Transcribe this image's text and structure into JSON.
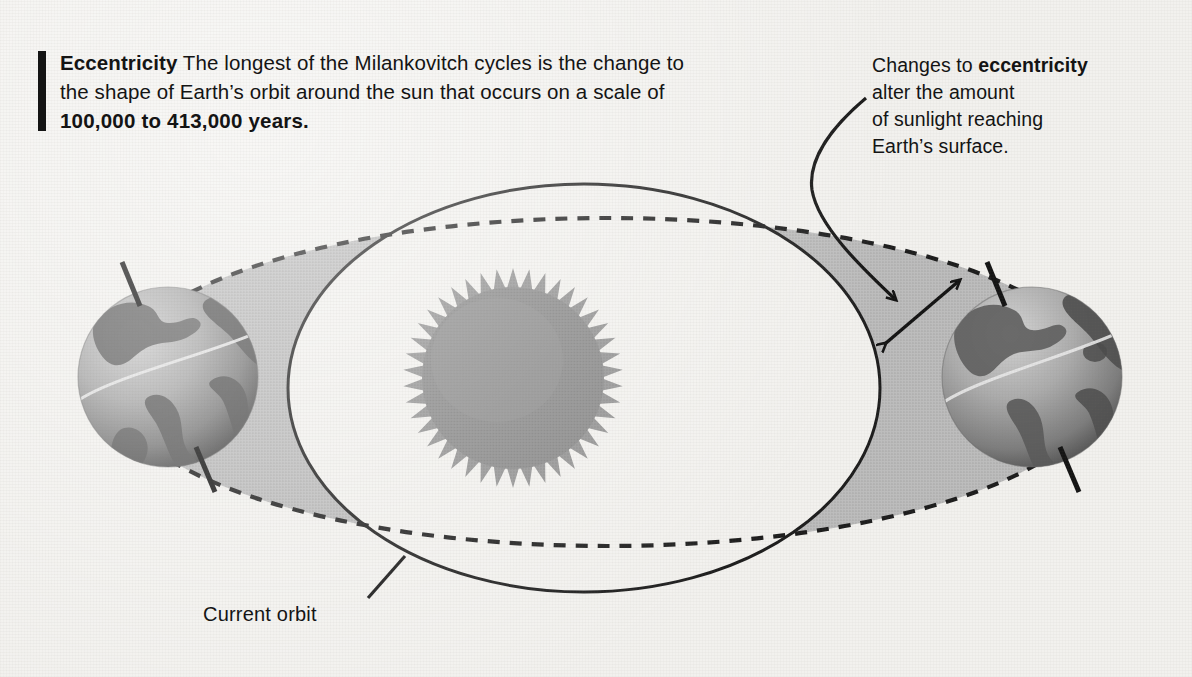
{
  "figure": {
    "title_term": "Eccentricity",
    "background_color": "#f2f1ee",
    "ink_color": "#141414",
    "shade_color": "#b9b9b9"
  },
  "callout": {
    "lead": "Eccentricity",
    "body_part1": " The longest of the Milankovitch cycles is the change to the shape of Earth’s orbit around the sun that occurs on a scale of ",
    "highlight": "100,000 to 413,000 years.",
    "accent_bar": "accent-bar"
  },
  "annotation": {
    "line1_pre": "Changes to ",
    "line1_bold": "eccentricity",
    "line2": "alter the amount",
    "line3": "of sunlight reaching",
    "line4": "Earth’s surface."
  },
  "labels": {
    "current_orbit": "Current orbit"
  },
  "diagram": {
    "sun": {
      "name": "sun",
      "center_x": 513,
      "center_y": 378,
      "core_radius": 90,
      "corona_radius": 110,
      "spikes": 42,
      "color": "#8e8e8e"
    },
    "earth_left": {
      "name": "earth-left",
      "center_x": 168,
      "center_y": 377,
      "radius": 90,
      "axis_tilt_degrees": 23.5
    },
    "earth_right": {
      "name": "earth-right",
      "center_x": 1032,
      "center_y": 377,
      "radius": 90,
      "axis_tilt_degrees": 23.5
    },
    "orbit_current": {
      "name": "current-orbit",
      "style": "solid",
      "center_x": 584,
      "center_y": 388,
      "rx": 296,
      "ry": 204
    },
    "orbit_eccentric": {
      "name": "eccentric-orbit",
      "style": "dashed",
      "center_x": 607,
      "center_y": 382,
      "rx": 497,
      "ry": 164
    },
    "pointer_arrow": {
      "name": "pointer-arrow",
      "from_x": 863,
      "from_y": 100,
      "to_x": 898,
      "to_y": 306
    },
    "span_arrow": {
      "name": "double-headed-span-arrow",
      "from_x": 884,
      "from_y": 345,
      "to_x": 962,
      "to_y": 278
    },
    "leader_line": {
      "name": "current-orbit-leader-line",
      "from_x": 368,
      "from_y": 598,
      "to_x": 404,
      "to_y": 557
    }
  },
  "chart_data": {
    "type": "diagram",
    "annotations": [
      "Eccentricity The longest of the Milankovitch cycles is the change to the shape of Earth’s orbit around the sun that occurs on a scale of 100,000 to 413,000 years.",
      "Changes to eccentricity alter the amount of sunlight reaching Earth’s surface.",
      "Current orbit"
    ],
    "cycle_period_years_min": 100000,
    "cycle_period_years_max": 413000,
    "elements": [
      "sun",
      "earth-left",
      "earth-right",
      "current-orbit-ellipse",
      "eccentric-orbit-ellipse",
      "shaded-difference-region"
    ]
  }
}
